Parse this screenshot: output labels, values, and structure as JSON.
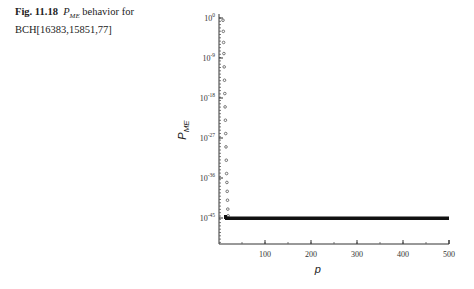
{
  "caption": {
    "fig_label": "Fig. 11.18",
    "symbol_main": "P",
    "symbol_sub": "ME",
    "text_line1": " behavior for",
    "text_line2": "BCH[16383,15851,77]"
  },
  "chart_data": {
    "type": "scatter",
    "xlabel": "p",
    "ylabel": "P_ME",
    "xlim": [
      0,
      500
    ],
    "ylim_log10": [
      -50,
      0
    ],
    "yscale": "log",
    "x_ticks": [
      100,
      200,
      300,
      400,
      500
    ],
    "x_tick_labels": [
      "100",
      "200",
      "300",
      "400",
      "500"
    ],
    "y_ticks_log10": [
      0,
      -9,
      -18,
      -27,
      -36,
      -45
    ],
    "y_tick_labels": [
      "10^0",
      "10^-9",
      "10^-18",
      "10^-27",
      "10^-36",
      "10^-45"
    ],
    "grid": false,
    "legend": null,
    "series": [
      {
        "name": "P_ME",
        "x": [
          1,
          2,
          3,
          4,
          5,
          6,
          7,
          8,
          9,
          10,
          11,
          12,
          13,
          14,
          15,
          16,
          17,
          18,
          20,
          25,
          50,
          100,
          150,
          200,
          250,
          300,
          350,
          400,
          450,
          500
        ],
        "log10_y": [
          -0.5,
          -3,
          -5.5,
          -8,
          -11,
          -14,
          -17,
          -20,
          -23,
          -26,
          -29,
          -32,
          -35,
          -37,
          -39,
          -41,
          -43,
          -44.5,
          -45,
          -45,
          -45,
          -45,
          -45,
          -45,
          -45,
          -45,
          -45,
          -45,
          -45,
          -45
        ]
      }
    ],
    "annotations": "Plateau at ~10^-45 for p > ~20"
  }
}
